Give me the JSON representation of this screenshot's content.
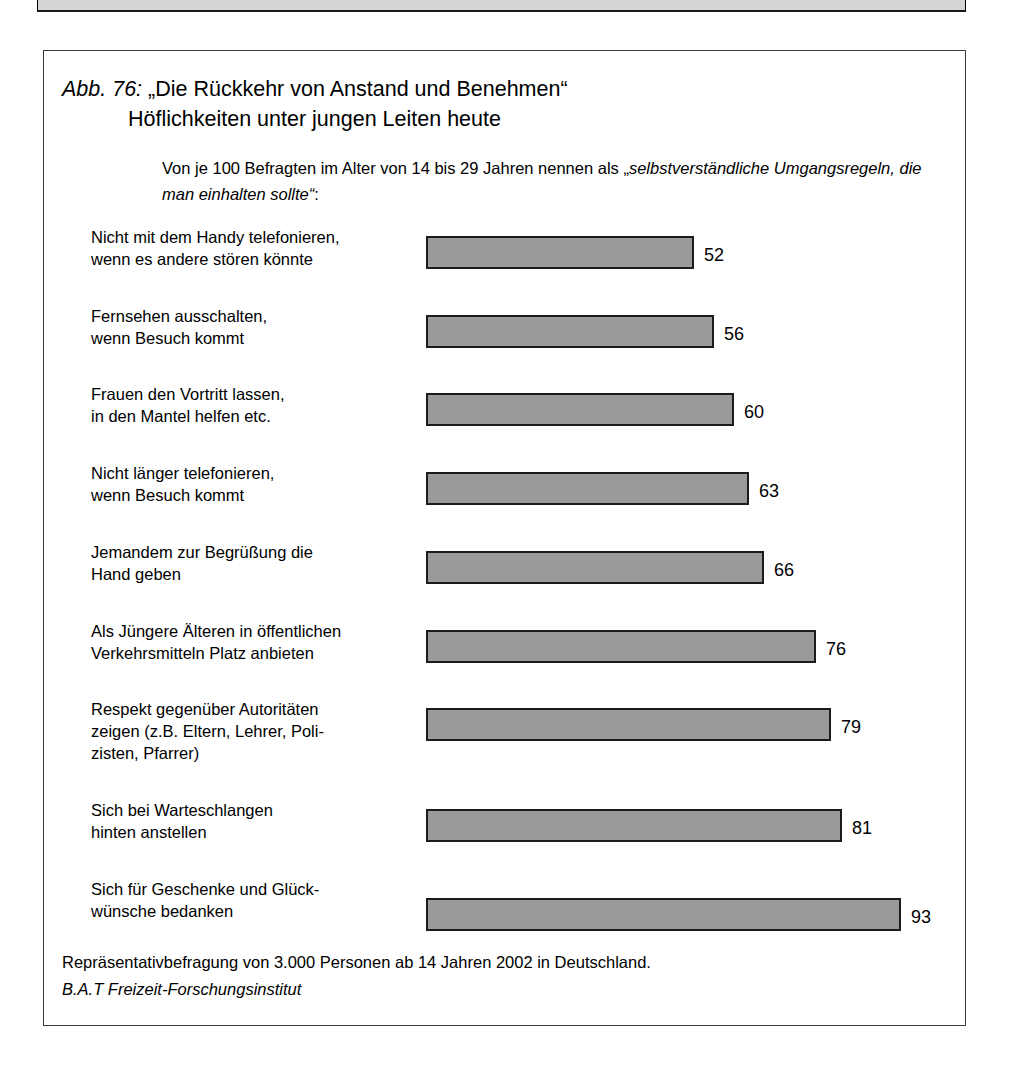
{
  "figure": {
    "number_label": "Abb. 76:",
    "title_line_1": "„Die Rückkehr von Anstand und Benehmen“",
    "title_line_2": "Höflichkeiten unter jungen Leiten heute",
    "subtitle_part_1": "Von je 100 Befragten im Alter von 14 bis 29 Jahren nennen als „",
    "subtitle_emphasis": "selbstverständliche Umgangsregeln, die man einhalten sollte“",
    "subtitle_part_3": ":",
    "footer_line_1": "Repräsentativbefragung von 3.000 Personen ab 14 Jahren 2002 in Deutschland.",
    "footer_source": "B.A.T Freizeit-Forschungsinstitut"
  },
  "chart_data": {
    "type": "bar",
    "orientation": "horizontal",
    "subtitle": "Von je 100 Befragten im Alter von 14 bis 29 Jahren nennen als „selbstverständliche Umgangsregeln, die man einhalten sollte“:",
    "xlabel": "",
    "ylabel": "",
    "xlim": [
      0,
      100
    ],
    "grid": false,
    "legend": false,
    "bar_color": "#9a9a9a",
    "bar_border_color": "#1c1c1c",
    "categories": [
      "Nicht mit dem Handy telefonieren,\nwenn es andere stören könnte",
      "Fernsehen ausschalten,\nwenn Besuch kommt",
      "Frauen den Vortritt lassen,\nin den Mantel helfen etc.",
      "Nicht länger telefonieren,\nwenn Besuch kommt",
      "Jemandem zur Begrüßung die\nHand geben",
      "Als Jüngere Älteren in öffentlichen\nVerkehrsmitteln Platz anbieten",
      "Respekt gegenüber Autoritäten\nzeigen (z.B. Eltern, Lehrer, Poli-\nzisten, Pfarrer)",
      "Sich bei Warteschlangen\nhinten anstellen",
      "Sich für Geschenke und Glück-\nwünsche bedanken"
    ],
    "values": [
      52,
      56,
      60,
      63,
      66,
      76,
      79,
      81,
      93
    ],
    "value_labels": [
      "52",
      "56",
      "60",
      "63",
      "66",
      "76",
      "79",
      "81",
      "93"
    ],
    "source": "B.A.T Freizeit-Forschungsinstitut",
    "note": "Repräsentativbefragung von 3.000 Personen ab 14 Jahren 2002 in Deutschland."
  },
  "layout": {
    "bar_rows": [
      {
        "top": 0,
        "label_top": 0,
        "bar_top": 10,
        "width": 268,
        "value_left": 278,
        "value_top": 20
      },
      {
        "top": 79,
        "label_top": 0,
        "bar_top": 10,
        "width": 288,
        "value_left": 298,
        "value_top": 20
      },
      {
        "top": 157,
        "label_top": 0,
        "bar_top": 10,
        "width": 308,
        "value_left": 318,
        "value_top": 20
      },
      {
        "top": 236,
        "label_top": 0,
        "bar_top": 10,
        "width": 323,
        "value_left": 333,
        "value_top": 20
      },
      {
        "top": 315,
        "label_top": 0,
        "bar_top": 10,
        "width": 338,
        "value_left": 348,
        "value_top": 20
      },
      {
        "top": 394,
        "label_top": 0,
        "bar_top": 10,
        "width": 390,
        "value_left": 400,
        "value_top": 20
      },
      {
        "top": 472,
        "label_top": 0,
        "bar_top": 10,
        "width": 405,
        "value_left": 415,
        "value_top": 20
      },
      {
        "top": 573,
        "label_top": 0,
        "bar_top": 10,
        "width": 416,
        "value_left": 426,
        "value_top": 20
      },
      {
        "top": 652,
        "label_top": 0,
        "bar_top": 20,
        "width": 475,
        "value_left": 485,
        "value_top": 30
      }
    ]
  }
}
